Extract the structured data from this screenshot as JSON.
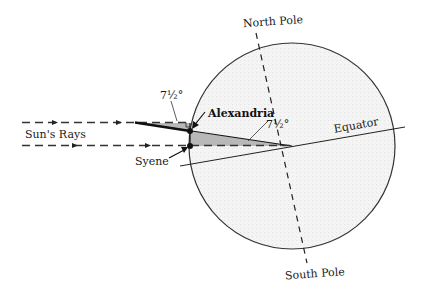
{
  "diagram": {
    "labels": {
      "north_pole": "North Pole",
      "south_pole": "South Pole",
      "equator": "Equator",
      "suns_rays": "Sun's Rays",
      "alexandria": "Alexandria",
      "syene": "Syene",
      "angle_at_alexandria": "7½°",
      "angle_at_center": "7½°"
    },
    "colors": {
      "earth_fill": "#f3f3f3",
      "wedge_fill": "#b9b9b9",
      "stroke": "#222222"
    },
    "geometry": {
      "earth_center": [
        292,
        146
      ],
      "earth_radius": 103,
      "alexandria_point": [
        190,
        131
      ],
      "syene_point": [
        190,
        146
      ]
    }
  }
}
